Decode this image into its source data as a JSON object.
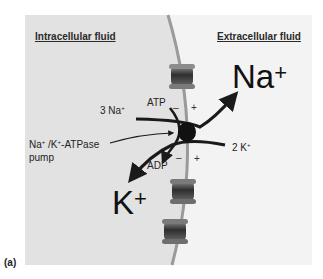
{
  "figure": {
    "panel_label": "(a)",
    "regions": {
      "intracellular": "Intracellular fluid",
      "extracellular": "Extracellular fluid"
    },
    "ions": {
      "na_big": "Na",
      "na_big_charge": "+",
      "k_big": "K",
      "k_big_charge": "+",
      "na_count": "3 Na",
      "na_count_charge": "+",
      "k_count": "2 K",
      "k_count_charge": "+"
    },
    "energy": {
      "atp": "ATP",
      "adp": "ADP"
    },
    "pump_label": {
      "line1_a": "Na",
      "line1_a_charge": "+",
      "line1_b": " /K",
      "line1_b_charge": "+",
      "line1_c": "-ATPase",
      "line2": "pump"
    },
    "charges": {
      "top_minus": "–",
      "top_plus": "+",
      "bottom_minus": "–",
      "bottom_plus": "+"
    },
    "colors": {
      "intracellular_bg": "#e4e4e4",
      "extracellular_bg": "#f4f4f4",
      "membrane": "#9a9a9a",
      "arrows": "#1a1a1a",
      "pump": "#111111",
      "channel_dark": "#3c3c3c",
      "channel_light": "#8a8a8a"
    }
  }
}
